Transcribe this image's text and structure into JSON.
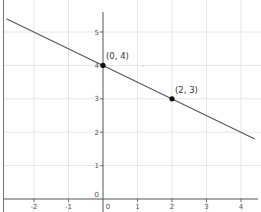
{
  "chart_data": {
    "type": "line",
    "title": "",
    "xlabel": "",
    "ylabel": "",
    "xlim": [
      -2.9,
      4.5
    ],
    "ylim": [
      -0.2,
      5.9
    ],
    "grid": true,
    "x_ticks": [
      -2,
      -1,
      0,
      1,
      2,
      3,
      4
    ],
    "y_ticks": [
      0,
      1,
      2,
      3,
      4,
      5
    ],
    "x_tick_labels": [
      "-2",
      "-1",
      "0",
      "1",
      "2",
      "3",
      "4"
    ],
    "y_tick_labels": [
      "0",
      "1",
      "2",
      "3",
      "4",
      "5"
    ],
    "series": [
      {
        "name": "line",
        "equation": "y = -0.5x + 4",
        "slope": -0.5,
        "intercept": 4,
        "x": [
          -2.8,
          4.4
        ],
        "y": [
          5.4,
          1.8
        ],
        "color": "#555555"
      }
    ],
    "points": [
      {
        "x": 0,
        "y": 4,
        "label": "(0, 4)"
      },
      {
        "x": 2,
        "y": 3,
        "label": "(2, 3)"
      }
    ]
  },
  "colors": {
    "grid": "#e6e6e6",
    "axis": "#555555",
    "line": "#555555",
    "point": "#111111",
    "border": "#666666"
  }
}
